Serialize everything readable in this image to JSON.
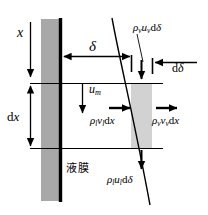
{
  "figure": {
    "name": "liquid-film-control-volume",
    "width": 208,
    "height": 215,
    "background_color": "#ffffff"
  },
  "colors": {
    "wall_fill": "#a8a8a8",
    "wall_line": "#000000",
    "film_element_fill": "#d0d0d0",
    "stroke": "#000000"
  },
  "labels": {
    "x": {
      "symbol": "x",
      "sub": "",
      "upright": ""
    },
    "dx": {
      "prefix": "d",
      "symbol": "x"
    },
    "delta": {
      "symbol": "δ"
    },
    "d_delta": {
      "prefix": "d",
      "symbol": "δ"
    },
    "rho_v_u_v_ddelta": {
      "rho": "ρ",
      "rho_sub": "v",
      "u": "u",
      "u_sub": "v",
      "d": "d",
      "delta": "δ"
    },
    "u_m": {
      "symbol": "u",
      "sub": "m"
    },
    "rho_l_v_l_dx": {
      "rho": "ρ",
      "rho_sub": "l",
      "v": "v",
      "v_sub": "l",
      "d": "d",
      "x": "x"
    },
    "rho_v_v_v_dx": {
      "rho": "ρ",
      "rho_sub": "v",
      "v": "v",
      "v_sub": "v",
      "d": "d",
      "x": "x"
    },
    "rho_l_u_l_ddelta": {
      "rho": "ρ",
      "rho_sub": "l",
      "u": "u",
      "u_sub": "l",
      "d": "d",
      "delta": "δ"
    },
    "liquid_film_cjk": "液膜"
  },
  "geometry": {
    "wall_rect": {
      "x": 41,
      "y": 19,
      "width": 19,
      "height": 182
    },
    "wall_line_x": 60,
    "wall_line_top": 18,
    "wall_line_bottom": 202,
    "film_element_rect": {
      "x": 131,
      "y": 83,
      "width": 21,
      "height": 65
    },
    "top_section_line_y": 83,
    "bottom_section_line_y": 148,
    "section_line_x1": 30,
    "section_line_x2": 163,
    "interface_curve": {
      "x_top": 112,
      "y_top": 18,
      "x_bottom": 150,
      "y_bottom": 205
    },
    "x_axis_arrow": {
      "x": 30,
      "y_from": 22,
      "y_to": 80
    },
    "dx_arrow": {
      "x": 30,
      "y_from": 83,
      "y_to": 148
    },
    "delta_arrow": {
      "y": 56,
      "x_from": 62,
      "x_to": 131
    },
    "d_delta_arrow": {
      "y": 62,
      "x_from": 197,
      "x_to": 153
    },
    "u_m_arrow": {
      "x": 82,
      "y_from": 84,
      "y_to": 117
    },
    "rho_v_u_v_arrow": {
      "x": 141,
      "y_from": 62,
      "y_to": 82
    },
    "rho_l_v_l_arrow": {
      "x_from": 110,
      "x_to": 131,
      "y": 108
    },
    "rho_v_v_v_arrow": {
      "x_from": 156,
      "x_to": 178,
      "y": 108
    },
    "rho_l_u_l_arrow": {
      "x": 141,
      "y_from": 150,
      "y_to": 172
    },
    "leader_line": {
      "x_from": 138,
      "y_from": 33,
      "x_to": 144,
      "y_to": 63
    }
  }
}
